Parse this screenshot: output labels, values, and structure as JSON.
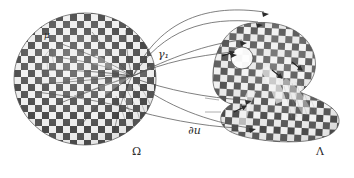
{
  "figure": {
    "kind": "mathematical-diagram",
    "background_color": "#ffffff",
    "ink_color": "#2b2b2b",
    "texture": {
      "name": "checkerboard",
      "cell_px": 7,
      "light": "#e8e8e8",
      "mid": "#9a9a9a",
      "dark": "#3a3a3a"
    }
  },
  "labels": [
    {
      "id": "mu",
      "text": "μ",
      "x": 44,
      "y": 36,
      "size": 9,
      "italic": true,
      "name": "label-mu"
    },
    {
      "id": "gamma1",
      "text": "γ₁",
      "x": 158,
      "y": 55,
      "size": 10,
      "italic": true,
      "name": "label-gamma-1"
    },
    {
      "id": "du",
      "text": "∂u",
      "x": 188,
      "y": 130,
      "size": 10,
      "italic": true,
      "name": "label-partial-u"
    },
    {
      "id": "omega",
      "text": "Ω",
      "x": 132,
      "y": 152,
      "size": 10,
      "italic": false,
      "name": "label-omega"
    },
    {
      "id": "lambda",
      "text": "Λ",
      "x": 316,
      "y": 152,
      "size": 10,
      "italic": false,
      "name": "label-lambda"
    }
  ],
  "shapes": {
    "source_domain": {
      "name": "Omega",
      "type": "disk",
      "center_x": 85,
      "center_y": 79,
      "radius_x": 71,
      "radius_y": 66
    },
    "target_domain": {
      "name": "Lambda",
      "type": "blob-with-hole",
      "bounds": {
        "x": 213,
        "y": 22,
        "width": 128,
        "height": 120
      },
      "hole": {
        "cx": 242,
        "cy": 58,
        "rx": 11,
        "ry": 11
      }
    }
  },
  "connectors": {
    "count": 6,
    "style": "thin-curved-arcs",
    "from": "disk-right-focus",
    "to": "blob-left-boundary"
  },
  "fan": {
    "name": "caustic-fan",
    "focus_x": 132,
    "focus_y": 76,
    "ray_count": 11
  }
}
